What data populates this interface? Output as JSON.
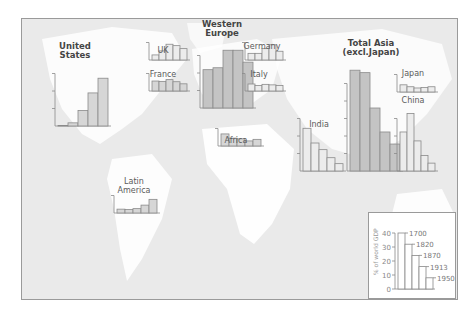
{
  "chart_data": {
    "type": "bar",
    "ylabel": "% of world GDP",
    "categories": [
      "1700",
      "1820",
      "1870",
      "1913",
      "1950"
    ],
    "ylim": [
      0,
      60
    ],
    "grid": false,
    "legend": {
      "position": "bottom-right",
      "ylabel": "% of world GDP",
      "yticks": [
        "0",
        "10",
        "20",
        "30",
        "40"
      ],
      "example_values": [
        40,
        32,
        24,
        16,
        8
      ],
      "bar_labels": [
        "1700",
        "1820",
        "1870",
        "1913",
        "1950"
      ]
    },
    "series": [
      {
        "name": "United States",
        "values": [
          0.1,
          1.8,
          8.9,
          18.9,
          27.3
        ]
      },
      {
        "name": "UK",
        "values": [
          2.9,
          5.2,
          9.0,
          8.2,
          6.5
        ]
      },
      {
        "name": "France",
        "values": [
          5.7,
          5.5,
          6.5,
          5.3,
          4.1
        ]
      },
      {
        "name": "Western Europe",
        "values": [
          21.9,
          23.0,
          33.0,
          33.0,
          26.2
        ]
      },
      {
        "name": "Germany",
        "values": [
          3.8,
          3.8,
          6.5,
          8.7,
          5.0
        ]
      },
      {
        "name": "Italy",
        "values": [
          4.0,
          3.2,
          3.8,
          3.5,
          3.1
        ]
      },
      {
        "name": "India",
        "values": [
          24.4,
          16.0,
          12.2,
          7.6,
          4.2
        ]
      },
      {
        "name": "Total Asia (excl.Japan)",
        "values": [
          57.6,
          56.2,
          36.0,
          22.3,
          15.4
        ]
      },
      {
        "name": "Japan",
        "values": [
          4.1,
          3.0,
          2.3,
          2.6,
          3.0
        ]
      },
      {
        "name": "China",
        "values": [
          22.3,
          32.9,
          17.2,
          8.9,
          4.5
        ]
      },
      {
        "name": "Africa",
        "values": [
          6.9,
          4.5,
          4.1,
          2.9,
          3.8
        ]
      },
      {
        "name": "Latin America",
        "values": [
          2.2,
          2.0,
          2.5,
          4.5,
          7.8
        ]
      }
    ]
  },
  "labels": {
    "us": "United\nStates",
    "uk": "UK",
    "france": "France",
    "western_europe": "Western\nEurope",
    "germany": "Germany",
    "italy": "Italy",
    "india": "India",
    "total_asia": "Total Asia\n(excl.Japan)",
    "japan": "Japan",
    "china": "China",
    "africa": "Africa",
    "latin_america": "Latin\nAmerica"
  },
  "colors": {
    "ocean": "#eaeaea",
    "land": "#ffffff",
    "bar_fill_light": "#ececec",
    "bar_fill_mid": "#d6d6d6",
    "bar_fill_dark": "#c4c4c4",
    "bar_stroke": "#8a8a8a"
  }
}
